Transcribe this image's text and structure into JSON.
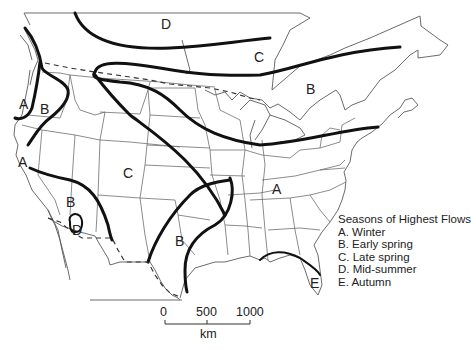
{
  "map": {
    "type": "thematic map",
    "region": "North America (United States and southern Canada)",
    "zone_labels": [
      {
        "id": "D",
        "x": 160,
        "y": 20
      },
      {
        "id": "C",
        "x": 255,
        "y": 52
      },
      {
        "id": "B",
        "x": 308,
        "y": 83
      },
      {
        "id": "A",
        "x": 18,
        "y": 96
      },
      {
        "id": "B",
        "x": 40,
        "y": 103
      },
      {
        "id": "A",
        "x": 17,
        "y": 156
      },
      {
        "id": "C",
        "x": 123,
        "y": 166
      },
      {
        "id": "B",
        "x": 66,
        "y": 197
      },
      {
        "id": "D",
        "x": 72,
        "y": 224
      },
      {
        "id": "A",
        "x": 272,
        "y": 183
      },
      {
        "id": "B",
        "x": 176,
        "y": 235
      },
      {
        "id": "E",
        "x": 310,
        "y": 274
      }
    ]
  },
  "legend": {
    "title": "Seasons of Highest Flows",
    "items": [
      "A. Winter",
      "B. Early spring",
      "C. Late spring",
      "D. Mid-summer",
      "E. Autumn"
    ]
  },
  "scale_bar": {
    "ticks": [
      "0",
      "500",
      "1000"
    ],
    "unit": "km"
  }
}
